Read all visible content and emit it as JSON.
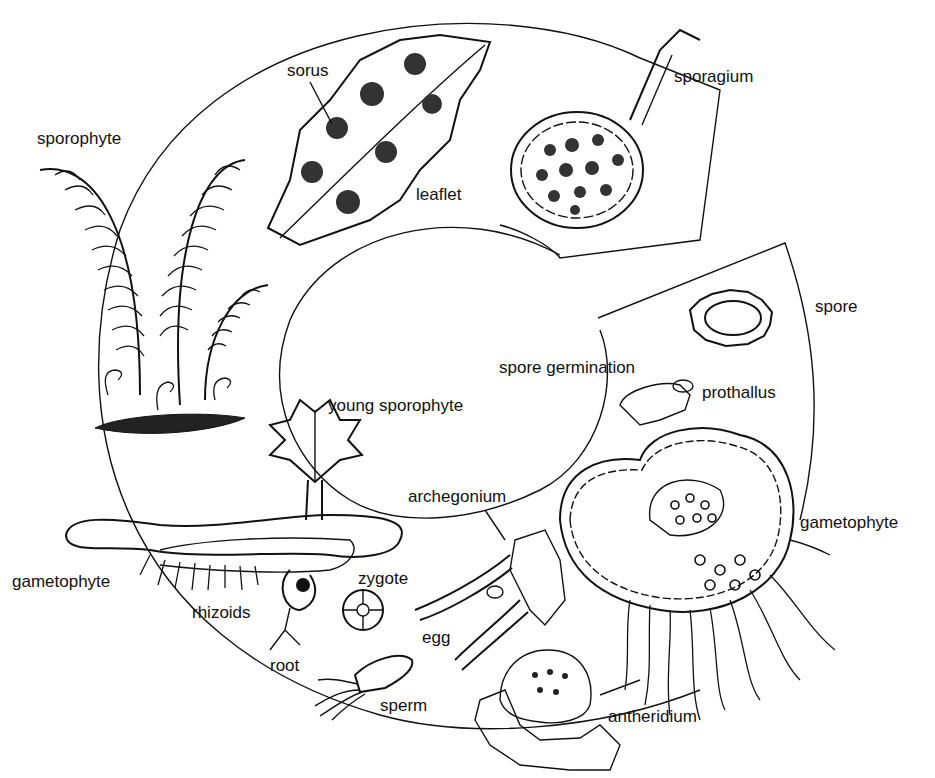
{
  "colors": {
    "ink": "#111111",
    "background": "#ffffff"
  },
  "labels": {
    "sporophyte": "sporophyte",
    "sorus": "sorus",
    "leaflet": "leaflet",
    "sporagium": "sporagium",
    "spore": "spore",
    "spore_germination": "spore germination",
    "prothallus": "prothallus",
    "gametophyte_right": "gametophyte",
    "antheridium": "antheridium",
    "archegonium": "archegonium",
    "egg": "egg",
    "sperm": "sperm",
    "zygote": "zygote",
    "root": "root",
    "rhizoids": "rhizoids",
    "gametophyte_left": "gametophyte",
    "young_sporophyte": "young sporophyte"
  },
  "stages": [
    "sporophyte",
    "leaflet with sorus",
    "sporagium",
    "spore",
    "spore germination / prothallus",
    "gametophyte",
    "antheridium / archegonium",
    "sperm / egg",
    "zygote",
    "young sporophyte"
  ]
}
